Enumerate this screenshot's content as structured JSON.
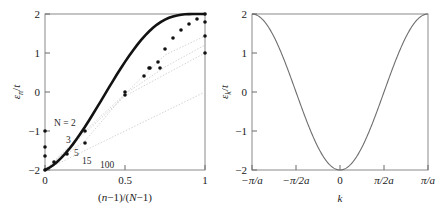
{
  "figure": {
    "background": "#ffffff",
    "ink": "#1a1a1a",
    "faint": "#c8c8c8",
    "curve_color": "#111111",
    "thin_curve_color": "#6e6e6e"
  },
  "chart_data": [
    {
      "type": "scatter",
      "panel": "left",
      "title": "",
      "xlabel": "(n−1)/(N−1)",
      "ylabel": "εₙ/t",
      "xlim": [
        0,
        1
      ],
      "ylim": [
        -2,
        2
      ],
      "xticks": [
        0,
        0.5,
        1
      ],
      "xticklabels": [
        "0",
        "0.5",
        "1"
      ],
      "yticks": [
        -2,
        -1,
        0,
        1,
        2
      ],
      "yticklabels": [
        "−2",
        "−1",
        "0",
        "1",
        "2"
      ],
      "grid": false,
      "legend": "inline-annotations",
      "annotations": [
        {
          "text": "N = 2",
          "x": 0.06,
          "y": -0.58
        },
        {
          "text": "3",
          "x": 0.12,
          "y": -1.02
        },
        {
          "text": "5",
          "x": 0.17,
          "y": -1.36
        },
        {
          "text": "15",
          "x": 0.22,
          "y": -1.56
        },
        {
          "text": "100",
          "x": 0.34,
          "y": -1.84
        }
      ],
      "series": [
        {
          "name": "N = 2",
          "style": "dotted-faint",
          "x": [
            0,
            1
          ],
          "values": [
            -2,
            0
          ]
        },
        {
          "name": "N = 3",
          "style": "dotted-faint",
          "x": [
            0,
            0.5,
            1
          ],
          "values": [
            -2,
            -0.2,
            1.0
          ]
        },
        {
          "name": "N = 5",
          "style": "dotted-faint",
          "x": [
            0,
            0.25,
            0.5,
            0.75,
            1
          ],
          "values": [
            -2,
            -1.0,
            -0.05,
            0.65,
            1.25
          ]
        },
        {
          "name": "N = 15",
          "style": "dotted-faint",
          "x": [
            0,
            0.25,
            0.5,
            0.75,
            1
          ],
          "values": [
            -2,
            -1.25,
            -0.1,
            0.95,
            1.48
          ]
        },
        {
          "name": "N = 100",
          "style": "thick-dotted",
          "description": "εₙ/t = −2 cos(π n/(N+1)) limiting curve",
          "x": [
            0,
            0.05,
            0.1,
            0.15,
            0.2,
            0.25,
            0.3,
            0.35,
            0.4,
            0.45,
            0.5,
            0.55,
            0.6,
            0.65,
            0.7,
            0.75,
            0.8,
            0.85,
            0.9,
            0.95,
            1
          ],
          "values": [
            -2.0,
            -1.95,
            -1.81,
            -1.59,
            -1.31,
            -1.0,
            -0.68,
            -0.35,
            -0.03,
            0.28,
            0.56,
            0.83,
            1.08,
            1.3,
            1.49,
            1.65,
            1.78,
            1.89,
            1.96,
            1.99,
            2.0
          ]
        },
        {
          "name": "sampled points",
          "style": "markers",
          "x": [
            0.0,
            0.0,
            0.0,
            0.0,
            0.25,
            0.25,
            0.5,
            0.07,
            0.14,
            0.5,
            0.75,
            0.75,
            0.62,
            0.72,
            0.8,
            0.86,
            0.93,
            1.0,
            1.0,
            1.0,
            1.0
          ],
          "values": [
            -2.0,
            -1.75,
            -1.55,
            -1.0,
            -1.0,
            -1.3,
            -0.1,
            -1.78,
            -1.6,
            0.0,
            0.93,
            0.62,
            0.62,
            1.12,
            1.4,
            1.62,
            1.82,
            2.0,
            1.78,
            1.48,
            1.0
          ]
        }
      ]
    },
    {
      "type": "line",
      "panel": "right",
      "title": "",
      "xlabel": "k",
      "ylabel": "εₖ/t",
      "xlim": [
        -1,
        1
      ],
      "ylim": [
        -2,
        2
      ],
      "xticks": [
        -1,
        -0.5,
        0,
        0.5,
        1
      ],
      "xticklabels": [
        "−π/a",
        "−π/2a",
        "0",
        "π/2a",
        "π/a"
      ],
      "yticks": [
        -2,
        -1,
        0,
        1,
        2
      ],
      "yticklabels": [
        "−2",
        "−1",
        "0",
        "1",
        "2"
      ],
      "grid": false,
      "legend": "none",
      "series": [
        {
          "name": "εₖ/t = −2 cos(ka)",
          "style": "thin-solid",
          "x": [
            -1.0,
            -0.95,
            -0.9,
            -0.85,
            -0.8,
            -0.75,
            -0.7,
            -0.65,
            -0.6,
            -0.55,
            -0.5,
            -0.45,
            -0.4,
            -0.35,
            -0.3,
            -0.25,
            -0.2,
            -0.15,
            -0.1,
            -0.05,
            0.0,
            0.05,
            0.1,
            0.15,
            0.2,
            0.25,
            0.3,
            0.35,
            0.4,
            0.45,
            0.5,
            0.55,
            0.6,
            0.65,
            0.7,
            0.75,
            0.8,
            0.85,
            0.9,
            0.95,
            1.0
          ],
          "values": [
            2.0,
            1.99,
            1.95,
            1.89,
            1.81,
            1.71,
            1.58,
            1.43,
            1.27,
            1.08,
            0.88,
            0.66,
            0.44,
            0.2,
            -0.05,
            -0.29,
            -0.54,
            -0.78,
            -1.0,
            -1.21,
            -2.0,
            -1.21,
            -1.0,
            -0.78,
            -0.54,
            -0.29,
            -0.05,
            0.2,
            0.44,
            0.66,
            0.88,
            1.08,
            1.27,
            1.43,
            1.58,
            1.71,
            1.81,
            1.89,
            1.95,
            1.99,
            2.0
          ]
        }
      ]
    }
  ],
  "left_panel": {
    "name": "tight-binding-levels-panel",
    "ylabel": "εₙ/t",
    "xlabel_num": "(n−1)",
    "xlabel_den": "(N−1)",
    "xticklabels": [
      "0",
      "0.5",
      "1"
    ],
    "yticklabels": [
      "2",
      "1",
      "0",
      "−1",
      "−2"
    ],
    "annotations": [
      "N = 2",
      "3",
      "5",
      "15",
      "100"
    ]
  },
  "right_panel": {
    "name": "dispersion-panel",
    "ylabel": "εₖ/t",
    "xlabel": "k",
    "xticklabels": [
      "−π/a",
      "−π/2a",
      "0",
      "π/2a",
      "π/a"
    ],
    "yticklabels": [
      "2",
      "1",
      "0",
      "−1",
      "−2"
    ]
  }
}
